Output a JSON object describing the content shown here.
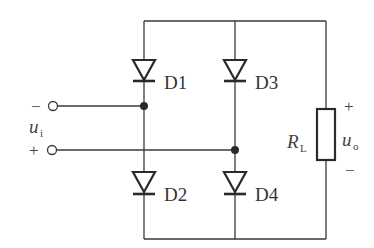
{
  "diagram": {
    "type": "bridge-rectifier-circuit",
    "diodes": [
      {
        "id": "D1",
        "label": "D1"
      },
      {
        "id": "D2",
        "label": "D2"
      },
      {
        "id": "D3",
        "label": "D3"
      },
      {
        "id": "D4",
        "label": "D4"
      }
    ],
    "input": {
      "label_main": "u",
      "label_sub": "i",
      "minus_sign": "−",
      "plus_sign": "+"
    },
    "load": {
      "resistor_main": "R",
      "resistor_sub": "L",
      "output_main": "u",
      "output_sub": "o",
      "plus_sign": "+",
      "minus_sign": "−"
    },
    "colors": {
      "line": "#3a3a3a",
      "background": "#ffffff"
    }
  }
}
